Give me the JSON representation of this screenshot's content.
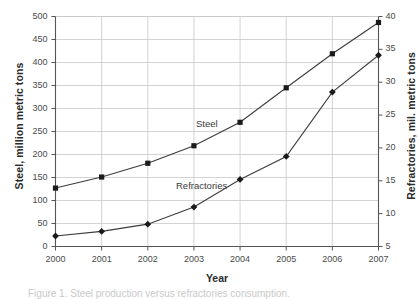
{
  "chart_data": {
    "type": "line",
    "title": "",
    "xlabel": "Year",
    "ylabel": "Steel, million metric tons",
    "y2label": "Refractories, mil. metric tons",
    "categories": [
      "2000",
      "2001",
      "2002",
      "2003",
      "2004",
      "2005",
      "2006",
      "2007"
    ],
    "ylim": [
      0,
      500
    ],
    "y2lim": [
      5,
      40
    ],
    "yticks": [
      "0",
      "50",
      "100",
      "150",
      "200",
      "250",
      "300",
      "350",
      "400",
      "450",
      "500"
    ],
    "y2ticks": [
      "5",
      "10",
      "15",
      "20",
      "25",
      "30",
      "35",
      "40"
    ],
    "grid": true,
    "legend_position": "inline-annotations",
    "series": [
      {
        "name": "Steel",
        "axis": "left",
        "marker": "square",
        "color": "#1a1a1a",
        "values": [
          127,
          151,
          181,
          219,
          270,
          345,
          419,
          487
        ]
      },
      {
        "name": "Refractories",
        "axis": "right",
        "marker": "diamond",
        "color": "#1a1a1a",
        "values": [
          6.6,
          7.3,
          8.4,
          11.0,
          15.2,
          18.7,
          28.5,
          34.1
        ]
      }
    ],
    "annotations": [
      {
        "text": "Steel",
        "x": "2004",
        "series": "Steel"
      },
      {
        "text": "Refractories",
        "x": "2004",
        "series": "Refractories"
      }
    ]
  },
  "caption": {
    "text": "Figure 1. Steel production versus refractories consumption."
  },
  "colors": {
    "axis": "#555555",
    "grid": "#c8c8c8",
    "line": "#3c3c3c",
    "marker": "#1a1a1a",
    "text": "#3a3a3a"
  }
}
